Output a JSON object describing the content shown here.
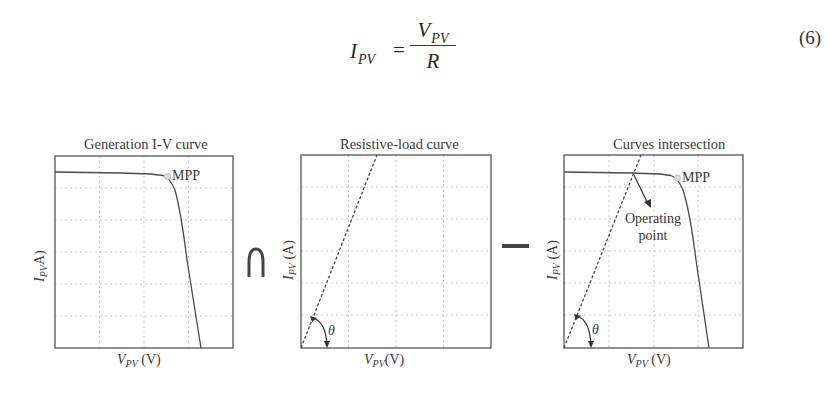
{
  "equation": {
    "lhs_var": "I",
    "lhs_sub": "PV",
    "equals": "=",
    "numerator_var": "V",
    "numerator_sub": "PV",
    "denominator": "R",
    "number": "(6)"
  },
  "figure": {
    "operators": {
      "intersection": "∩",
      "equals_dash": "—"
    },
    "panels": [
      {
        "title": "Generation  I-V curve",
        "ylabel_var": "I",
        "ylabel_sub": "PV",
        "ylabel_unit": "A)",
        "xlabel_var": "V",
        "xlabel_sub": "PV",
        "xlabel_unit": " (V)",
        "annotations": [
          "MPP"
        ]
      },
      {
        "title": "Resistive-load curve",
        "ylabel_var": "I",
        "ylabel_sub": "PV",
        "ylabel_unit": " (A)",
        "xlabel_var": "V",
        "xlabel_sub": "PV",
        "xlabel_unit": "(V)",
        "annotations": [
          "θ"
        ]
      },
      {
        "title": "Curves intersection",
        "ylabel_var": "I",
        "ylabel_sub": "PV",
        "ylabel_unit": " (A)",
        "xlabel_var": "V",
        "xlabel_sub": "PV",
        "xlabel_unit": " (V)",
        "annotations": [
          "MPP",
          "Operating",
          "point",
          "θ"
        ]
      }
    ]
  },
  "colors": {
    "curve": "#4a4a4a",
    "grid": "#c8c8c8",
    "axis": "#555555",
    "mpp_marker": "#bdbdbd"
  }
}
